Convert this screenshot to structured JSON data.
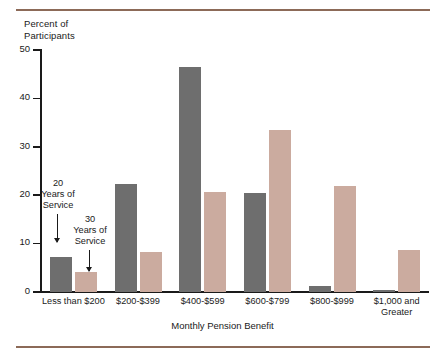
{
  "chart_data": {
    "type": "bar",
    "title": "",
    "xlabel": "Monthly Pension Benefit",
    "ylabel": "Percent of\nParticipants",
    "categories": [
      "Less than $200",
      "$200-$399",
      "$400-$599",
      "$600-$799",
      "$800-$999",
      "$1,000 and\nGreater"
    ],
    "series": [
      {
        "name": "20 Years of Service",
        "color": "#6e6e6e",
        "values": [
          7.2,
          22.4,
          46.4,
          20.4,
          1.2,
          0.4
        ]
      },
      {
        "name": "30 Years of Service",
        "color": "#cbab9f",
        "values": [
          4.2,
          8.3,
          20.6,
          33.5,
          22.0,
          8.6
        ]
      }
    ],
    "ylim": [
      0,
      50
    ],
    "yticks": [
      0,
      10,
      20,
      30,
      40,
      50
    ],
    "ytick_labels": [
      "0",
      "10",
      "20",
      "30",
      "40",
      "50"
    ],
    "grid": false,
    "legend": "none"
  },
  "annotations": [
    {
      "id": "series-20-annotation",
      "text": "20\nYears of\nService",
      "points_to": "Less than $200 / 20 Years of Service bar"
    },
    {
      "id": "series-30-annotation",
      "text": "30\nYears of\nService",
      "points_to": "Less than $200 / 30 Years of Service bar"
    }
  ],
  "rules": {
    "color": "#8c6a58"
  }
}
